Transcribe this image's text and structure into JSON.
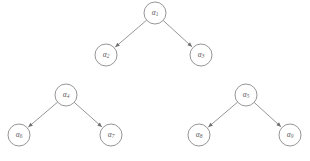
{
  "figure": {
    "type": "directed-graph",
    "background_color": "#ffffff",
    "stroke_color": "#8a8a8a",
    "label_color": "#5d5d5d",
    "node_radius": 11,
    "canvas": {
      "width": 310,
      "height": 161
    },
    "caption_partial": ""
  },
  "nodes": [
    {
      "id": "a1",
      "base": "α",
      "subscript": "1",
      "label": "α1",
      "cx": 155,
      "cy": 13,
      "tree": 1,
      "role": "root"
    },
    {
      "id": "a2",
      "base": "α",
      "subscript": "2",
      "label": "α2",
      "cx": 106,
      "cy": 55,
      "tree": 1,
      "role": "left-child"
    },
    {
      "id": "a3",
      "base": "α",
      "subscript": "3",
      "label": "α3",
      "cx": 201,
      "cy": 55,
      "tree": 1,
      "role": "right-child"
    },
    {
      "id": "a4",
      "base": "α",
      "subscript": "4",
      "label": "α4",
      "cx": 66,
      "cy": 95,
      "tree": 2,
      "role": "root"
    },
    {
      "id": "a6",
      "base": "α",
      "subscript": "6",
      "label": "α6",
      "cx": 19,
      "cy": 135,
      "tree": 2,
      "role": "left-child"
    },
    {
      "id": "a7",
      "base": "α",
      "subscript": "7",
      "label": "α7",
      "cx": 111,
      "cy": 135,
      "tree": 2,
      "role": "right-child"
    },
    {
      "id": "a5",
      "base": "α",
      "subscript": "5",
      "label": "α5",
      "cx": 246,
      "cy": 95,
      "tree": 3,
      "role": "root"
    },
    {
      "id": "a8",
      "base": "α",
      "subscript": "8",
      "label": "α8",
      "cx": 199,
      "cy": 135,
      "tree": 3,
      "role": "left-child"
    },
    {
      "id": "a9",
      "base": "α",
      "subscript": "9",
      "label": "α9",
      "cx": 290,
      "cy": 135,
      "tree": 3,
      "role": "right-child"
    }
  ],
  "edges": [
    {
      "from": "a1",
      "to": "a2",
      "directed": true
    },
    {
      "from": "a1",
      "to": "a3",
      "directed": true
    },
    {
      "from": "a4",
      "to": "a6",
      "directed": true
    },
    {
      "from": "a4",
      "to": "a7",
      "directed": true
    },
    {
      "from": "a5",
      "to": "a8",
      "directed": true
    },
    {
      "from": "a5",
      "to": "a9",
      "directed": true
    }
  ]
}
